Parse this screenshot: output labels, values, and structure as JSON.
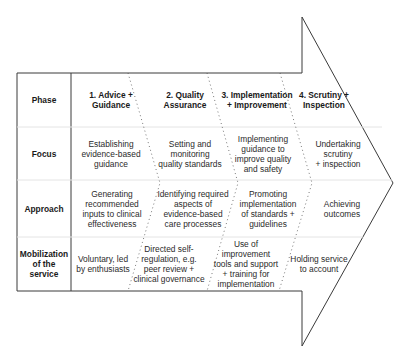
{
  "row_labels": {
    "phase": "Phase",
    "focus": "Focus",
    "approach": "Approach",
    "mobilization": "Mobilization\nof the\nservice"
  },
  "phases": [
    {
      "title": "1. Advice +\n  Guidance",
      "focus": "Establishing\nevidence-based\nguidance",
      "approach": "Generating\nrecommended\ninputs to clinical\neffectiveness",
      "mobilization": "Voluntary, led\nby enthusiasts"
    },
    {
      "title": "2. Quality\n    Assurance",
      "focus": "Setting and\nmonitoring\nquality standards",
      "approach": "Identifying required\naspects of\nevidence-based\ncare processes",
      "mobilization": "Directed self-\nregulation, e.g.\npeer review +\nclinical governance"
    },
    {
      "title": "3. Implementation\n+ Improvement",
      "focus": "Implementing\nguidance to\nimprove quality\nand safety",
      "approach": "Promoting\nimplementation\nof standards +\nguidelines",
      "mobilization": "Use of\nimprovement\ntools and support\n+ training for\nimplementation"
    },
    {
      "title": "4. Scrutiny +\n  Inspection",
      "focus": "Undertaking\nscrutiny\n+ inspection",
      "approach": "Achieving outcomes",
      "mobilization": "Holding service\nto account"
    }
  ],
  "colors": {
    "outline": "#3a3a3a",
    "row_divider": "#e6e6e6",
    "dotted_divider": "#555555",
    "text": "#2b2b2b"
  }
}
